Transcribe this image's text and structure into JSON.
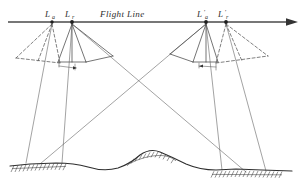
{
  "figure": {
    "type": "diagram",
    "background_color": "#ffffff",
    "ink_color": "#3a3a3a",
    "width": 304,
    "height": 190
  },
  "flight_line": {
    "label": "Flight Line",
    "y": 22,
    "x_start": 8,
    "x_end": 296,
    "arrow": "right",
    "arrow_icon": "arrow-right-icon"
  },
  "stations": [
    {
      "id": "La",
      "label": "L",
      "subscript": "a",
      "prime": "",
      "x": 52,
      "y": 22
    },
    {
      "id": "Lr",
      "label": "L",
      "subscript": "r",
      "prime": "",
      "x": 72,
      "y": 22
    },
    {
      "id": "Lap",
      "label": "L",
      "subscript": "a",
      "prime": "'",
      "x": 206,
      "y": 22
    },
    {
      "id": "Lrp",
      "label": "L",
      "subscript": "r",
      "prime": "'",
      "x": 226,
      "y": 22
    }
  ],
  "station_labels": [
    {
      "text": "La",
      "x": 45,
      "y": 17
    },
    {
      "text": "Lr",
      "x": 65,
      "y": 17
    },
    {
      "text": "L'a",
      "x": 198,
      "y": 17
    },
    {
      "text": "L'r",
      "x": 219,
      "y": 17
    }
  ],
  "camera_cones": {
    "description": "Each station projects a camera cone; oblique cones drawn dashed, vertical cones drawn solid",
    "left_group": {
      "dashed_cone_from": "La",
      "solid_cone_from": "Lr",
      "film_plane_y": 63
    },
    "right_group": {
      "solid_cone_from": "Lap",
      "dashed_cone_from": "Lrp",
      "film_plane_y": 63
    }
  },
  "principal_rays": {
    "description": "Long convergent rays crossing below the flight line",
    "crossing_point": {
      "x": 136,
      "y": 86
    }
  },
  "terrain": {
    "label": "",
    "baseline_y": 163,
    "hatched_segments": [
      {
        "id": "left-photographed-area",
        "x_start": 14,
        "x_end": 66,
        "y": 164
      },
      {
        "id": "center-photographed-area",
        "x_start": 128,
        "x_end": 170,
        "y": 155
      },
      {
        "id": "right-photographed-area",
        "x_start": 214,
        "x_end": 282,
        "y": 170
      }
    ]
  },
  "notes": {
    "caption": ""
  }
}
